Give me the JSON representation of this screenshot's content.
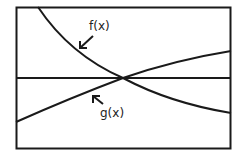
{
  "diagram": {
    "curves": [
      {
        "name": "f(x)",
        "label": "f(x)",
        "behavior": "decreasing"
      },
      {
        "name": "g(x)",
        "label": "g(x)",
        "behavior": "increasing"
      }
    ],
    "horizontal_line": true,
    "colors": {
      "stroke": "#1a1a1a",
      "background": "#ffffff"
    }
  }
}
